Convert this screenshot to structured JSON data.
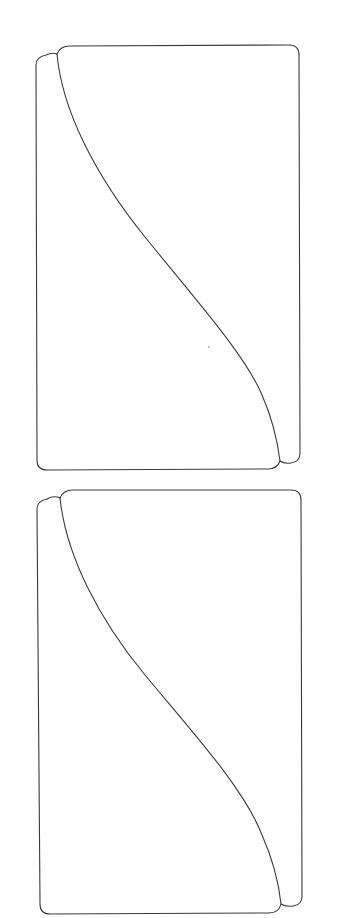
{
  "page": {
    "width": 348,
    "height": 918,
    "background": "#ffffff"
  },
  "style": {
    "stroke_color": "#3a3a3a",
    "stroke_width": 1.1,
    "speck_color": "#555555"
  },
  "figures": [
    {
      "id": "figure-1",
      "description": "Rounded rectangular panel divided by an S-shaped curve from a top-left notch to a bottom-right notch",
      "outer_path": "M 46 55 Q 52 52 57 54 Q 60 46 70 46 L 289 45 Q 299 45 299 55 L 300 453 Q 300 462 291 463 Q 284 464 280 461 Q 277 469 268 469 L 47 470 Q 37 470 37 460 L 36 65 Q 36 57 46 55 Z",
      "divider_path": "M 57 54 C 62 110 95 175 145 237 C 200 305 245 355 262 395 C 273 420 278 445 280 461",
      "speck": {
        "x": 209,
        "y": 347,
        "r": 0.7
      }
    },
    {
      "id": "figure-2",
      "description": "Second, identical view of the rounded rectangular panel with the S-shaped dividing curve",
      "outer_path": "M 47 499 Q 54 495 60 498 Q 63 490 73 490 L 291 490 Q 301 490 301 500 L 302 896 Q 302 905 293 906 Q 285 907 281 904 Q 279 913 269 913 L 50 914 Q 40 914 40 904 L 37 509 Q 37 501 47 499 Z",
      "divider_path": "M 60 498 C 66 555 98 618 145 675 C 195 735 245 790 262 835 C 274 862 279 885 281 904",
      "speck": null
    }
  ]
}
